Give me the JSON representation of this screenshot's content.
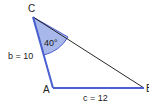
{
  "diagram": {
    "type": "triangle",
    "vertices": {
      "A": {
        "label": "A"
      },
      "B": {
        "label": "B"
      },
      "C": {
        "label": "C"
      }
    },
    "sides": {
      "b": {
        "label": "b = 10",
        "between": [
          "C",
          "A"
        ],
        "length": 10
      },
      "c": {
        "label": "c = 12",
        "between": [
          "A",
          "B"
        ],
        "length": 12
      },
      "a": {
        "label": "",
        "between": [
          "C",
          "B"
        ]
      }
    },
    "angle_C": {
      "label": "40°",
      "degrees": 40
    },
    "colors": {
      "highlight_side": "#4a5fd0",
      "angle_fill": "#a9b8ea",
      "angle_stroke": "#4a5fd0",
      "plain_side": "#111111"
    }
  }
}
